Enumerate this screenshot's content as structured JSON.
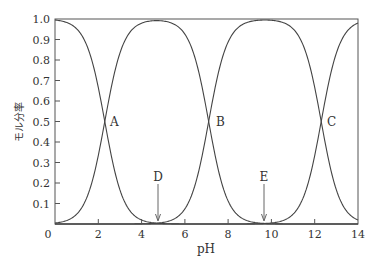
{
  "chart_data": {
    "type": "line",
    "title": "",
    "xlabel": "pH",
    "ylabel": "モル分率",
    "xlim": [
      0,
      14
    ],
    "ylim": [
      0,
      1.0
    ],
    "x_ticks": [
      "0",
      "2",
      "4",
      "6",
      "8",
      "10",
      "12",
      "14"
    ],
    "y_ticks": [
      "0.1",
      "0.2",
      "0.3",
      "0.4",
      "0.5",
      "0.6",
      "0.7",
      "0.8",
      "0.9",
      "1.0"
    ],
    "grid": false,
    "legend": null,
    "pKa": [
      2.3,
      7.1,
      12.3
    ],
    "series": [
      {
        "name": "species-0 (fully protonated)",
        "description": "decreasing from 1.0 at pH 0 to ~0 by pH 4.5"
      },
      {
        "name": "species-1",
        "description": "rises around pKa1, plateau ~1.0 near pH 4.7, falls around pKa2"
      },
      {
        "name": "species-2",
        "description": "rises around pKa2, plateau ~1.0 near pH 9.7, falls around pKa3"
      },
      {
        "name": "species-3 (fully deprotonated)",
        "description": "rises from ~0 near pH 10 to ~0.97 at pH 14"
      }
    ],
    "annotations": [
      {
        "label": "A",
        "x": 2.3,
        "y": 0.5
      },
      {
        "label": "B",
        "x": 7.1,
        "y": 0.5
      },
      {
        "label": "C",
        "x": 12.3,
        "y": 0.5
      },
      {
        "label": "D",
        "x": 4.7,
        "arrow": true,
        "arrow_from_y": 0.16,
        "arrow_to_y": 0.0
      },
      {
        "label": "E",
        "x": 9.7,
        "arrow": true,
        "arrow_from_y": 0.16,
        "arrow_to_y": 0.0
      }
    ]
  },
  "labels": {
    "xlabel": "pH",
    "ylabel": "モル分率",
    "A": "A",
    "B": "B",
    "C": "C",
    "D": "D",
    "E": "E",
    "x0": "0",
    "x2": "2",
    "x4": "4",
    "x6": "6",
    "x8": "8",
    "x10": "10",
    "x12": "12",
    "x14": "14",
    "y01": "0.1",
    "y02": "0.2",
    "y03": "0.3",
    "y04": "0.4",
    "y05": "0.5",
    "y06": "0.6",
    "y07": "0.7",
    "y08": "0.8",
    "y09": "0.9",
    "y10": "1.0"
  }
}
